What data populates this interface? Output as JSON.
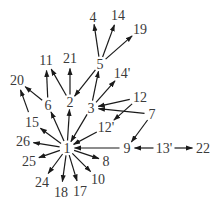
{
  "diagram": {
    "type": "directed-graph",
    "colors": {
      "edge": "#1a1a1a",
      "label": "#3a3a3a",
      "background": "#ffffff"
    },
    "nodes": [
      {
        "id": "1",
        "label": "1",
        "x": 67,
        "y": 148
      },
      {
        "id": "2",
        "label": "2",
        "x": 70,
        "y": 102
      },
      {
        "id": "3",
        "label": "3",
        "x": 91,
        "y": 108
      },
      {
        "id": "4",
        "label": "4",
        "x": 93,
        "y": 17
      },
      {
        "id": "5",
        "label": "5",
        "x": 100,
        "y": 64
      },
      {
        "id": "6",
        "label": "6",
        "x": 48,
        "y": 105
      },
      {
        "id": "7",
        "label": "7",
        "x": 152,
        "y": 114
      },
      {
        "id": "8",
        "label": "8",
        "x": 106,
        "y": 161
      },
      {
        "id": "9",
        "label": "9",
        "x": 127,
        "y": 148
      },
      {
        "id": "10",
        "label": "10",
        "x": 98,
        "y": 179
      },
      {
        "id": "11",
        "label": "11",
        "x": 46,
        "y": 60
      },
      {
        "id": "12",
        "label": "12",
        "x": 140,
        "y": 97
      },
      {
        "id": "12p",
        "label": "12'",
        "x": 106,
        "y": 127
      },
      {
        "id": "13p",
        "label": "13'",
        "x": 164,
        "y": 148
      },
      {
        "id": "14",
        "label": "14",
        "x": 118,
        "y": 15
      },
      {
        "id": "14p",
        "label": "14'",
        "x": 122,
        "y": 73
      },
      {
        "id": "15",
        "label": "15",
        "x": 32,
        "y": 122
      },
      {
        "id": "17",
        "label": "17",
        "x": 80,
        "y": 191
      },
      {
        "id": "18",
        "label": "18",
        "x": 61,
        "y": 192
      },
      {
        "id": "19",
        "label": "19",
        "x": 140,
        "y": 29
      },
      {
        "id": "20",
        "label": "20",
        "x": 17,
        "y": 80
      },
      {
        "id": "21",
        "label": "21",
        "x": 70,
        "y": 58
      },
      {
        "id": "22",
        "label": "22",
        "x": 203,
        "y": 148
      },
      {
        "id": "24",
        "label": "24",
        "x": 42,
        "y": 182
      },
      {
        "id": "25",
        "label": "25",
        "x": 29,
        "y": 161
      },
      {
        "id": "26",
        "label": "26",
        "x": 23,
        "y": 141
      }
    ],
    "edges": [
      {
        "from": "5",
        "to": "4"
      },
      {
        "from": "5",
        "to": "14"
      },
      {
        "from": "5",
        "to": "19"
      },
      {
        "from": "5",
        "to": "2"
      },
      {
        "from": "3",
        "to": "5"
      },
      {
        "from": "3",
        "to": "14p"
      },
      {
        "from": "12",
        "to": "3"
      },
      {
        "from": "7",
        "to": "3"
      },
      {
        "from": "12",
        "to": "12p"
      },
      {
        "from": "7",
        "to": "9"
      },
      {
        "from": "13p",
        "to": "9"
      },
      {
        "from": "13p",
        "to": "22"
      },
      {
        "from": "2",
        "to": "21"
      },
      {
        "from": "2",
        "to": "11"
      },
      {
        "from": "6",
        "to": "11"
      },
      {
        "from": "6",
        "to": "20"
      },
      {
        "from": "15",
        "to": "20"
      },
      {
        "from": "1",
        "to": "6"
      },
      {
        "from": "1",
        "to": "2"
      },
      {
        "from": "3",
        "to": "1"
      },
      {
        "from": "12p",
        "to": "1"
      },
      {
        "from": "9",
        "to": "1"
      },
      {
        "from": "1",
        "to": "15"
      },
      {
        "from": "1",
        "to": "26"
      },
      {
        "from": "1",
        "to": "25"
      },
      {
        "from": "1",
        "to": "24"
      },
      {
        "from": "1",
        "to": "18"
      },
      {
        "from": "1",
        "to": "17"
      },
      {
        "from": "1",
        "to": "10"
      },
      {
        "from": "1",
        "to": "8"
      }
    ]
  }
}
